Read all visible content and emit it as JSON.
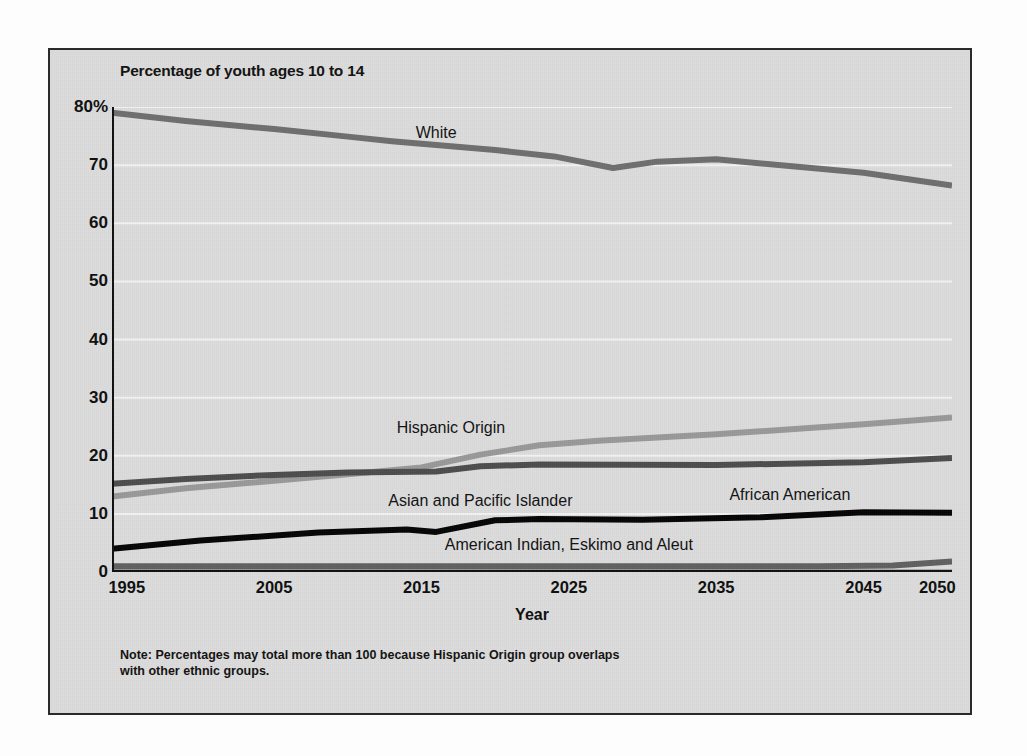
{
  "figure": {
    "title": "Percentage of youth ages 10 to 14",
    "x_axis_title": "Year",
    "note_line_1": "Note: Percentages may total more than 100 because Hispanic Origin group overlaps",
    "note_line_2": "with other ethnic groups."
  },
  "colors": {
    "panel_background": "#dcdcdc",
    "frame": "#2b2b2b",
    "gridline": "#f2f2f2",
    "axis": "#101010",
    "white_series": "#6e6e6e",
    "hispanic_series": "#999999",
    "african_american_series": "#4d4d4d",
    "asian_series": "#050505",
    "american_indian_series": "#606060"
  },
  "chart_data": {
    "type": "line",
    "title": "Percentage of youth ages 10 to 14",
    "xlabel": "Year",
    "ylabel": "Percentage of youth ages 10 to 14",
    "xlim": [
      1994,
      2051
    ],
    "ylim": [
      0,
      80
    ],
    "grid": true,
    "legend": "inline-labels",
    "x_ticks": [
      1995,
      2005,
      2015,
      2025,
      2035,
      2045,
      2050
    ],
    "x_tick_labels": [
      "1995",
      "2005",
      "2015",
      "2025",
      "2035",
      "2045",
      "2050"
    ],
    "y_ticks": [
      0,
      10,
      20,
      30,
      40,
      50,
      60,
      70,
      80
    ],
    "y_tick_labels": [
      "0",
      "10",
      "20",
      "30",
      "40",
      "50",
      "60",
      "70",
      "80%"
    ],
    "series": [
      {
        "name": "White",
        "color": "#6e6e6e",
        "label_x": 2016,
        "label_y": 75.5,
        "x": [
          1994,
          1999,
          2005,
          2010,
          2013,
          2020,
          2024,
          2028,
          2031,
          2035,
          2045,
          2051
        ],
        "values": [
          79.0,
          77.6,
          76.2,
          74.9,
          74.1,
          72.6,
          71.5,
          69.5,
          70.6,
          71.0,
          68.7,
          66.5
        ]
      },
      {
        "name": "Hispanic Origin",
        "color": "#999999",
        "label_x": 2017,
        "label_y": 24.8,
        "x": [
          1994,
          1999,
          2005,
          2010,
          2015,
          2019,
          2023,
          2027,
          2035,
          2045,
          2051
        ],
        "values": [
          13.0,
          14.4,
          15.7,
          16.8,
          18.0,
          20.2,
          21.8,
          22.6,
          23.7,
          25.4,
          26.6
        ]
      },
      {
        "name": "African American",
        "color": "#4d4d4d",
        "label_x": 2040,
        "label_y": 13.2,
        "x": [
          1994,
          1999,
          2005,
          2010,
          2016,
          2019,
          2023,
          2035,
          2045,
          2051
        ],
        "values": [
          15.2,
          16.0,
          16.7,
          17.1,
          17.3,
          18.2,
          18.5,
          18.4,
          18.9,
          19.6
        ]
      },
      {
        "name": "Asian and Pacific Islander",
        "color": "#050505",
        "label_x": 2019,
        "label_y": 12.3,
        "x": [
          1994,
          2000,
          2008,
          2014,
          2016,
          2020,
          2023,
          2030,
          2038,
          2045,
          2051
        ],
        "values": [
          4.0,
          5.4,
          6.8,
          7.3,
          6.9,
          8.9,
          9.1,
          9.0,
          9.4,
          10.3,
          10.2
        ]
      },
      {
        "name": "American Indian, Eskimo and Aleut",
        "color": "#606060",
        "label_x": 2025,
        "label_y": 4.6,
        "x": [
          1994,
          2010,
          2030,
          2042,
          2047,
          2051
        ],
        "values": [
          1.0,
          1.0,
          1.0,
          1.0,
          1.1,
          1.8
        ]
      }
    ]
  }
}
